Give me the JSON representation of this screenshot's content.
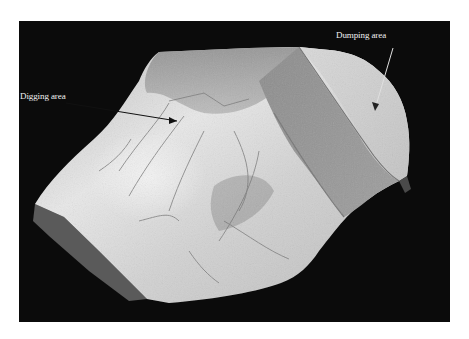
{
  "figure": {
    "annotations": [
      {
        "id": "digging",
        "label": "Digging area"
      },
      {
        "id": "dumping",
        "label": "Dumping area"
      }
    ],
    "colors": {
      "background": "#0b0b0b",
      "page": "#ffffff",
      "terrain_light": "#e6e6e6",
      "terrain_mid": "#a8a8a8",
      "terrain_dark": "#6e6e6e",
      "label_text": "#f2f2f2"
    }
  }
}
